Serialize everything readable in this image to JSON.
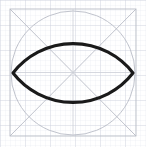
{
  "figure": {
    "canvas": {
      "width": 146,
      "height": 147,
      "background": "#ffffff"
    },
    "grid": {
      "visible": true,
      "minor_spacing": 5,
      "major_spacing": 25,
      "minor_color": "#e4e6ee",
      "major_color": "#c9ccd8",
      "minor_width": 0.5,
      "major_width": 0.7
    },
    "construction": {
      "color": "#b9bcc6",
      "stroke_width": 0.9,
      "square": {
        "x": 10,
        "y": 9,
        "width": 126,
        "height": 127
      },
      "diagonals": [
        {
          "x1": 10,
          "y1": 9,
          "x2": 136,
          "y2": 136
        },
        {
          "x1": 136,
          "y1": 9,
          "x2": 10,
          "y2": 136
        }
      ],
      "circle": {
        "cx": 73,
        "cy": 73,
        "r": 62
      },
      "midlines": [
        {
          "x1": 10,
          "y1": 72.5,
          "x2": 136,
          "y2": 72.5
        },
        {
          "x1": 73,
          "y1": 9,
          "x2": 73,
          "y2": 136
        }
      ]
    },
    "lens": {
      "label": "vesica-lens",
      "color": "#1a1a1a",
      "stroke_width": 3.1,
      "fill": "none",
      "left_vertex": {
        "x": 13,
        "y": 73
      },
      "right_vertex": {
        "x": 133,
        "y": 73
      },
      "top_apex": {
        "x": 73,
        "y": 38
      },
      "bottom_apex": {
        "x": 73,
        "y": 110
      },
      "arc_radius": 76
    }
  }
}
